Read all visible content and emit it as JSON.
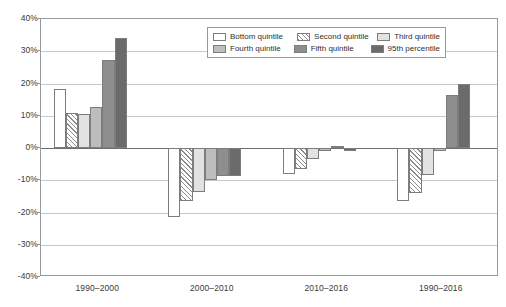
{
  "chart_data": {
    "type": "bar",
    "title": "",
    "xlabel": "",
    "ylabel": "",
    "ylim": [
      -40,
      40
    ],
    "ytick_labels": [
      "40%",
      "30%",
      "20%",
      "10%",
      "0%",
      "-10%",
      "-20%",
      "-30%",
      "-40%"
    ],
    "ytick_values": [
      40,
      30,
      20,
      10,
      0,
      -10,
      -20,
      -30,
      -40
    ],
    "grid": true,
    "legend_position": "top-center",
    "categories": [
      "1990–2000",
      "2000–2010",
      "2010–2016",
      "1990–2016"
    ],
    "series": [
      {
        "name": "Bottom quintile",
        "fill": "fill-bottom",
        "color": "#ffffff",
        "values": [
          18.2,
          -21.5,
          -8.0,
          -16.5
        ]
      },
      {
        "name": "Second quintile",
        "fill": "fill-second",
        "color": "#8d8d8d",
        "values": [
          11.0,
          -16.5,
          -6.5,
          -14.0
        ]
      },
      {
        "name": "Third quintile",
        "fill": "fill-third",
        "color": "#e2e2e2",
        "values": [
          10.6,
          -13.5,
          -3.5,
          -8.5
        ]
      },
      {
        "name": "Fourth quintile",
        "fill": "fill-fourth",
        "color": "#bdbdbd",
        "values": [
          12.8,
          -10.0,
          -1.0,
          -0.8
        ]
      },
      {
        "name": "Fifth quintile",
        "fill": "fill-fifth",
        "color": "#8e8e8e",
        "values": [
          27.2,
          -8.6,
          0.7,
          16.5
        ]
      },
      {
        "name": "95th percentile",
        "fill": "fill-p95",
        "color": "#6b6b6b",
        "values": [
          34.0,
          -8.6,
          -1.0,
          20.0
        ]
      }
    ]
  },
  "legend": {
    "entries": [
      "Bottom quintile",
      "Second quintile",
      "Third quintile",
      "Fourth quintile",
      "Fifth quintile",
      "95th percentile"
    ]
  }
}
